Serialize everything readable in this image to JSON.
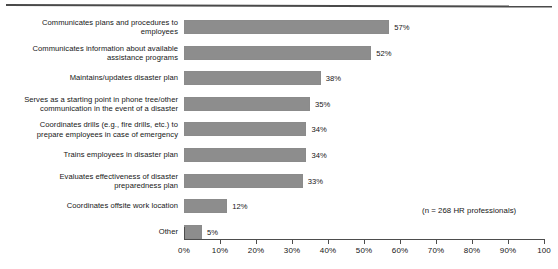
{
  "chart_data": {
    "type": "bar",
    "orientation": "horizontal",
    "title": "",
    "xlabel": "",
    "ylabel": "",
    "xlim": [
      0,
      100
    ],
    "grid": false,
    "legend": null,
    "note": "(n = 268 HR professionals)",
    "categories": [
      "Communicates plans and procedures to\nemployees",
      "Communicates information about available\nassistance programs",
      "Maintains/updates disaster plan",
      "Serves as a starting point in phone tree/other\ncommunication in the event of a disaster",
      "Coordinates drills (e.g., fire drills, etc.) to\nprepare employees in case of emergency",
      "Trains employees in disaster plan",
      "Evaluates effectiveness of disaster\npreparedness plan",
      "Coordinates offsite work location",
      "Other"
    ],
    "values": [
      57,
      52,
      38,
      35,
      34,
      34,
      33,
      12,
      5
    ],
    "value_labels": [
      "57%",
      "52%",
      "38%",
      "35%",
      "34%",
      "34%",
      "33%",
      "12%",
      "5%"
    ],
    "xticks": [
      0,
      10,
      20,
      30,
      40,
      50,
      60,
      70,
      80,
      90,
      100
    ],
    "xtick_labels": [
      "0%",
      "10%",
      "20%",
      "30%",
      "40%",
      "50%",
      "60%",
      "70%",
      "80%",
      "90%",
      "100"
    ],
    "bar_color": "#8d8d8d",
    "axis_color": "#4d4d4d",
    "text_color": "#161616",
    "background": "#ffffff"
  }
}
